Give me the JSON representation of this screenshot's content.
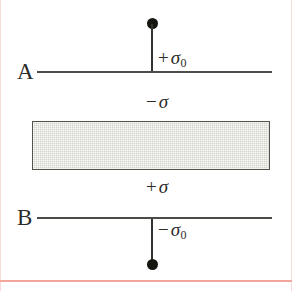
{
  "figure": {
    "width": 292,
    "height": 291,
    "background_color": "#ffffff"
  },
  "colors": {
    "line": "#4c4c49",
    "stem": "#323230",
    "dot": "#16150f",
    "slab_fill": "#d2d2cb",
    "slab_border": "#53534e",
    "text": "#2b2b28",
    "edge_rule": "#f6dcd8",
    "bottom_rule": "#f2a69e"
  },
  "planes": {
    "upper": {
      "name": "A",
      "charge_operator": "+",
      "charge_symbol": "σ",
      "charge_subscript": "0",
      "charge_label": "+ σ0"
    },
    "lower": {
      "name": "B",
      "charge_operator": "−",
      "charge_symbol": "σ",
      "charge_subscript": "0",
      "charge_label": "− σ0"
    }
  },
  "slab": {
    "top_surface": {
      "operator": "−",
      "symbol": "σ",
      "label": "− σ"
    },
    "bottom_surface": {
      "operator": "+",
      "symbol": "σ",
      "label": "+ σ"
    }
  },
  "markers": {
    "top_terminal": "charge-terminal-dot",
    "bottom_terminal": "charge-terminal-dot"
  }
}
